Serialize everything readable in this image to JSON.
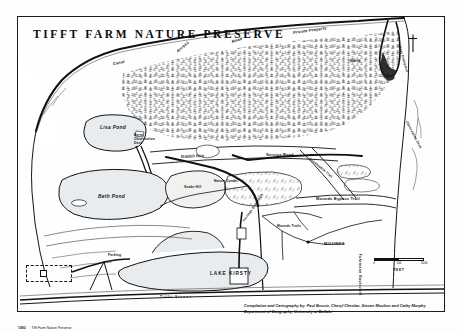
{
  "map": {
    "title": "TIFFT  FARM  NATURE  PRESERVE",
    "frame_color": "#1a1a1a",
    "paper_color": "#fdfdfb",
    "water_color": "#e9ecee",
    "marsh_color": "#f4f4f2"
  },
  "labels": {
    "canal": "Canal",
    "access": "Access",
    "road_top": "Road",
    "private_property": "Private Property",
    "wave_dissipator": "Wave Dissipator",
    "lisa_pond": "Lisa Pond",
    "berm_observation_deck": "Berm Observation Deck",
    "rabbit_run": "Rabbit Run",
    "beth_pond": "Beth Pond",
    "snake_hill": "Snake Hill",
    "service_road": "Service Road",
    "snowmobile_trail": "Snowmobile Trail",
    "fuhrmann_boulevard": "Fuhrmann Boulevard",
    "mounds_bypass_trail": "Mounds Bypass Trail",
    "mounds_trails": "Mounds Trails",
    "mounds": "MOUNDS",
    "lake_kirsty": "LAKE KIRSTY",
    "tifft_street": "Tifft  Street",
    "heritage_boardwalk": "Heritage Boardwalk",
    "nature_center": "Nature Center",
    "parking": "Parking",
    "observation_deck": "Observation Deck",
    "marsh": "Marsh"
  },
  "scale": {
    "ticks": [
      "0",
      "500",
      "1000"
    ],
    "unit": "FEET"
  },
  "legend": {
    "key": "1993",
    "value": "Tifft Farm Nature Preserve"
  },
  "credits": {
    "line1": "Compilation and Cartography by: Paul Boccio, Cheryl Cheslan, Steven Moulton and Cathy Murphy",
    "line2": "Department of Geography, University at Buffalo"
  }
}
